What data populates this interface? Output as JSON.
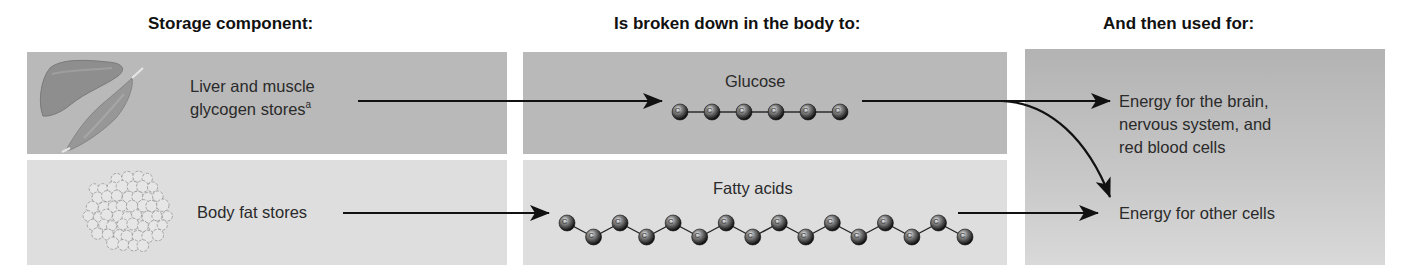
{
  "headers": {
    "storage": "Storage component:",
    "breakdown": "Is broken down in the body to:",
    "used_for": "And then used for:"
  },
  "rows": [
    {
      "storage_label_line1": "Liver and muscle",
      "storage_label_line2": "glycogen stores",
      "storage_footnote": "a",
      "storage_icons": [
        "liver-icon",
        "muscle-icon"
      ],
      "product_label": "Glucose",
      "product_carbons": 6,
      "product_shape": "straight-chain"
    },
    {
      "storage_label_line1": "Body fat stores",
      "storage_icons": [
        "fat-cells-icon"
      ],
      "product_label": "Fatty acids",
      "product_carbons": 16,
      "product_shape": "zigzag-chain"
    }
  ],
  "uses": [
    {
      "line1": "Energy for the brain,",
      "line2": "nervous system, and",
      "line3": "red blood cells"
    },
    {
      "line1": "Energy for other cells"
    }
  ],
  "atom_symbol": "C",
  "colors": {
    "top_row_panel": "#b9b9b9",
    "bottom_row_panel": "#dedede",
    "arrow": "#111111"
  }
}
